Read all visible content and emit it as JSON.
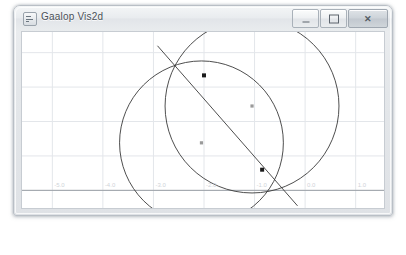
{
  "window": {
    "title": "Gaalop Vis2d",
    "icon": "app-icon",
    "controls": {
      "minimize": "–",
      "maximize": "□",
      "close": "✕"
    }
  },
  "chart_data": {
    "type": "scatter",
    "title": "",
    "xlabel": "",
    "ylabel": "",
    "grid": true,
    "legend": null,
    "xlim": [
      -5.6,
      1.6
    ],
    "ylim": [
      -0.6,
      4.6
    ],
    "xticks": [
      -5.0,
      -4.0,
      -3.0,
      -2.0,
      -1.0,
      0.0,
      1.0
    ],
    "xtick_labels": [
      "-5.0",
      "-4.0",
      "-3.0",
      "-2.0",
      "-1.0",
      "0.0",
      "1.0"
    ],
    "yticks": [
      0.0,
      1.0,
      2.0,
      3.0,
      4.0
    ],
    "ytick_labels": [
      "",
      "",
      "",
      "",
      ""
    ],
    "axis_color": "#9aa0a6",
    "grid_color": "#e3e6ea",
    "curve_color": "#3a3a3a",
    "point_color": "#1a1a1a",
    "center_color": "#9a9a9a",
    "circles": [
      {
        "name": "circle-large",
        "cx": -1.05,
        "cy": 2.45,
        "r": 1.72
      },
      {
        "name": "circle-small",
        "cx": -2.05,
        "cy": 1.38,
        "r": 1.62
      }
    ],
    "line": {
      "name": "intersection-line",
      "x1": -2.92,
      "y1": 4.2,
      "x2": -0.15,
      "y2": -0.45
    },
    "points": [
      {
        "name": "intersection-upper",
        "x": -2.0,
        "y": 3.34
      },
      {
        "name": "intersection-lower",
        "x": -0.85,
        "y": 0.6
      }
    ],
    "centers": [
      {
        "name": "center-large",
        "x": -1.05,
        "y": 2.45
      },
      {
        "name": "center-small",
        "x": -2.05,
        "y": 1.38
      }
    ]
  }
}
